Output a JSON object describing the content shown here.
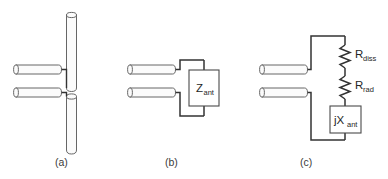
{
  "figure": {
    "background_color": "#ffffff",
    "line_color": "#333333",
    "rod_fill": "#fbfbfb",
    "rod_stroke": "#555555",
    "box_fill": "#ffffff",
    "box_stroke": "#4a4a4a",
    "text_color": "#262626",
    "caption_color": "#3a3a3a"
  },
  "panels": [
    {
      "id": "a",
      "caption": "(a)",
      "description": "dipole-antenna-physical",
      "caption_x": 55,
      "caption_y": 166
    },
    {
      "id": "b",
      "caption": "(b)",
      "description": "lumped-impedance-equivalent",
      "caption_x": 165,
      "caption_y": 166
    },
    {
      "id": "c",
      "caption": "(c)",
      "description": "series-rdiss-rrad-jxant-equivalent",
      "caption_x": 300,
      "caption_y": 166
    }
  ],
  "labels": {
    "z_ant": {
      "main": "Z",
      "sub": "ant"
    },
    "r_diss": {
      "main": "R",
      "sub": "diss"
    },
    "r_rad": {
      "main": "R",
      "sub": "rad"
    },
    "jx_ant": {
      "main": "jX",
      "sub": "ant"
    }
  },
  "components": {
    "panel_a": {
      "upper_element_label": "upper-dipole-arm",
      "lower_element_label": "lower-dipole-arm",
      "feed_line_upper_label": "upper-feed-rod",
      "feed_line_lower_label": "lower-feed-rod"
    },
    "panel_b": {
      "impedance_box_label": "antenna-impedance-box"
    },
    "panel_c": {
      "resistor_1_label": "dissipation-resistor",
      "resistor_2_label": "radiation-resistor",
      "reactance_box_label": "antenna-reactance-box"
    }
  }
}
